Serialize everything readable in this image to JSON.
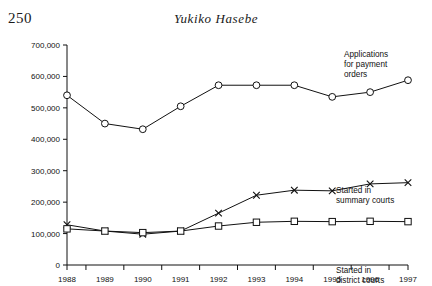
{
  "page": {
    "number": "250",
    "running_head": "Yukiko Hasebe"
  },
  "chart_data": {
    "type": "line",
    "title": "",
    "subtitle": "",
    "xlabel": "",
    "ylabel": "",
    "grid": false,
    "legend_position": "inline-annotations",
    "categories": [
      "1988",
      "1989",
      "1990",
      "1991",
      "1992",
      "1993",
      "1994",
      "1995",
      "1996",
      "1997"
    ],
    "x": [
      1988,
      1989,
      1990,
      1991,
      1992,
      1993,
      1994,
      1995,
      1996,
      1997
    ],
    "xlim": [
      1988,
      1997
    ],
    "ylim": [
      0,
      700000
    ],
    "y_ticks": [
      0,
      100000,
      200000,
      300000,
      400000,
      500000,
      600000,
      700000
    ],
    "y_tick_labels": [
      "0",
      "100,000",
      "200,000",
      "300,000",
      "400,000",
      "500,000",
      "600,000",
      "700,000"
    ],
    "series": [
      {
        "name": "Applications for payment orders",
        "marker": "circle",
        "label_lines": [
          "Applications",
          "for payment",
          "orders"
        ],
        "values": [
          540000,
          450000,
          432000,
          505000,
          572000,
          572000,
          572000,
          535000,
          550000,
          588000
        ]
      },
      {
        "name": "Started in summary courts",
        "marker": "cross",
        "label_lines": [
          "Started in",
          "summary courts"
        ],
        "values": [
          128000,
          108000,
          98000,
          108000,
          165000,
          222000,
          238000,
          236000,
          258000,
          262000
        ]
      },
      {
        "name": "Started in district courts",
        "marker": "square",
        "label_lines": [
          "Started in",
          "district courts"
        ],
        "values": [
          115000,
          108000,
          103000,
          108000,
          124000,
          136000,
          139000,
          138000,
          139000,
          138000
        ]
      }
    ]
  }
}
